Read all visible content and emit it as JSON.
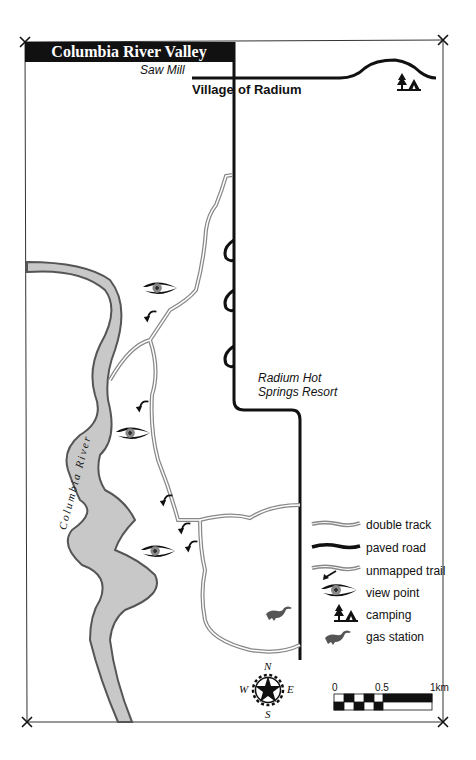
{
  "map": {
    "title": "Columbia River Valley",
    "places": {
      "saw_mill": "Saw Mill",
      "village_left": "Village",
      "village_right": "of Radium",
      "resort_line1": "Radium Hot",
      "resort_line2": "Springs Resort"
    },
    "river_label": "Columbia River",
    "legend": [
      {
        "icon": "double-track-icon",
        "label": "double track"
      },
      {
        "icon": "paved-road-icon",
        "label": "paved road"
      },
      {
        "icon": "unmapped-trail-icon",
        "label": "unmapped trail"
      },
      {
        "icon": "eye-icon",
        "label": "view point"
      },
      {
        "icon": "camping-icon",
        "label": "camping"
      },
      {
        "icon": "gas-station-icon",
        "label": "gas station"
      }
    ],
    "compass": {
      "n": "N",
      "s": "S",
      "e": "E",
      "w": "W"
    },
    "scale": {
      "ticks": [
        "0",
        "0.5",
        "1km"
      ]
    },
    "colors": {
      "ink": "#111111",
      "river": "#c8c8c8",
      "river_edge": "#555555",
      "track": "#888888"
    }
  }
}
